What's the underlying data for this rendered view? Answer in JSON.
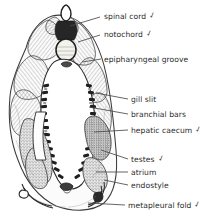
{
  "figure": {
    "style": "grayscale pen-and-ink line drawing",
    "background_color": "#ffffff",
    "ink_color": "#2b2b2b",
    "leader_line_color": "#4a4a4a",
    "check_mark_color": "#3a3a3a"
  },
  "labels": [
    {
      "id": "spinal-cord",
      "text": "spinal cord",
      "checked": true,
      "text_x": 104,
      "text_y": 12,
      "leader": {
        "x1": 100,
        "y1": 17,
        "x2": 70,
        "y2": 26
      }
    },
    {
      "id": "notochord",
      "text": "notochord",
      "checked": true,
      "text_x": 104,
      "text_y": 30,
      "leader": {
        "x1": 100,
        "y1": 35,
        "x2": 78,
        "y2": 42
      }
    },
    {
      "id": "epipharyngeal-groove",
      "text": "epipharyngeal groove",
      "checked": false,
      "text_x": 104,
      "text_y": 55,
      "leader": {
        "x1": 101,
        "y1": 59,
        "x2": 82,
        "y2": 62
      }
    },
    {
      "id": "gill-slit",
      "text": "gill slit",
      "checked": false,
      "text_x": 131,
      "text_y": 95,
      "leader": {
        "x1": 128,
        "y1": 99,
        "x2": 96,
        "y2": 93
      }
    },
    {
      "id": "branchial-bars",
      "text": "branchial bars",
      "checked": false,
      "text_x": 131,
      "text_y": 110,
      "leader": {
        "x1": 128,
        "y1": 114,
        "x2": 89,
        "y2": 107
      }
    },
    {
      "id": "hepatic-caecum",
      "text": "hepatic caecum",
      "checked": true,
      "text_x": 131,
      "text_y": 126,
      "leader": {
        "x1": 128,
        "y1": 130,
        "x2": 94,
        "y2": 132
      }
    },
    {
      "id": "testes",
      "text": "testes",
      "checked": true,
      "text_x": 131,
      "text_y": 155,
      "leader": {
        "x1": 128,
        "y1": 159,
        "x2": 101,
        "y2": 150
      }
    },
    {
      "id": "atrium",
      "text": "atrium",
      "checked": false,
      "text_x": 131,
      "text_y": 168,
      "leader": {
        "x1": 128,
        "y1": 172,
        "x2": 96,
        "y2": 172
      }
    },
    {
      "id": "endostyle",
      "text": "endostyle",
      "checked": false,
      "text_x": 131,
      "text_y": 181,
      "leader": {
        "x1": 128,
        "y1": 185,
        "x2": 104,
        "y2": 180
      }
    },
    {
      "id": "metapleural-fold",
      "text": "metapleural fold",
      "checked": true,
      "text_x": 128,
      "text_y": 201,
      "leader": {
        "x1": 125,
        "y1": 205,
        "x2": 88,
        "y2": 203
      }
    }
  ],
  "check_glyph": "✓"
}
